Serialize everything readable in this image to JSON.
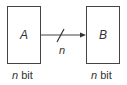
{
  "diagram": {
    "nodes": [
      {
        "id": "A",
        "label": "A",
        "caption_var": "n",
        "caption_unit": " bit"
      },
      {
        "id": "B",
        "label": "B",
        "caption_var": "n",
        "caption_unit": " bit"
      }
    ],
    "edge": {
      "from": "A",
      "to": "B",
      "bus_width_label": "n"
    }
  }
}
